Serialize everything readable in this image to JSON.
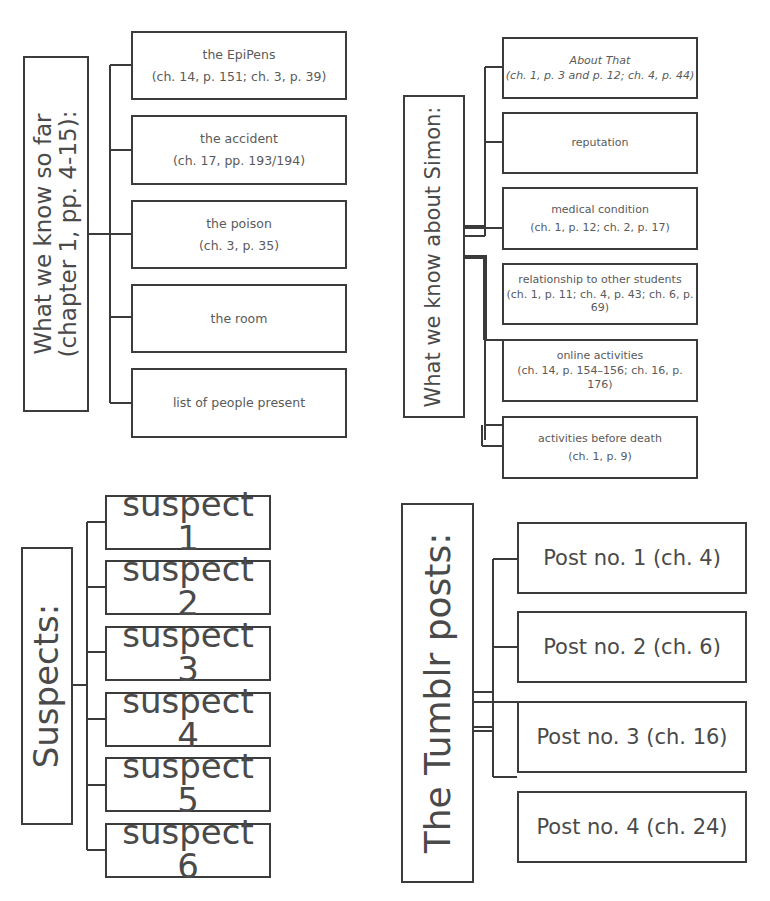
{
  "top_cut_text": "",
  "diagrams": {
    "known_so_far": {
      "label_line1": "What we know so far",
      "label_line2": "(chapter 1, pp. 4-15):",
      "items": [
        {
          "title": "the EpiPens",
          "ref": "(ch. 14, p. 151; ch. 3, p. 39)"
        },
        {
          "title": "the accident",
          "ref": "(ch. 17, pp. 193/194)"
        },
        {
          "title": "the poison",
          "ref": "(ch. 3, p. 35)"
        },
        {
          "title": "the room",
          "ref": ""
        },
        {
          "title": "list of people present",
          "ref": ""
        }
      ]
    },
    "about_simon": {
      "label": "What we know about Simon:",
      "items": [
        {
          "title": "About That",
          "ref": "(ch. 1, p. 3 and p. 12; ch. 4, p. 44)",
          "italic": true
        },
        {
          "title": "reputation",
          "ref": ""
        },
        {
          "title": "medical condition",
          "ref": "(ch. 1, p. 12; ch. 2, p. 17)"
        },
        {
          "title": "relationship to other students",
          "ref": "(ch. 1, p. 11; ch. 4, p. 43; ch. 6, p. 69)"
        },
        {
          "title": "online activities",
          "ref": "(ch. 14, p. 154–156;  ch. 16, p. 176)"
        },
        {
          "title": "activities before death",
          "ref": "(ch. 1, p. 9)"
        }
      ]
    },
    "suspects": {
      "label": "Suspects:",
      "items": [
        "suspect 1",
        "suspect 2",
        "suspect 3",
        "suspect 4",
        "suspect 5",
        "suspect 6"
      ]
    },
    "tumblr_posts": {
      "label": "The Tumblr posts:",
      "items": [
        "Post no. 1 (ch. 4)",
        "Post no. 2 (ch. 6)",
        "Post no. 3 (ch. 16)",
        "Post no. 4 (ch. 24)"
      ]
    }
  },
  "colors": {
    "border": "#3c3c3c",
    "text": "#5a5a5a",
    "background": "#ffffff"
  }
}
